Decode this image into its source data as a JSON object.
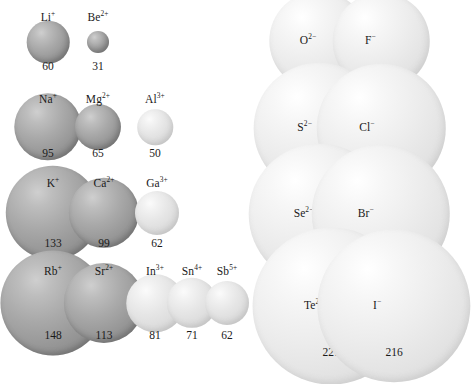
{
  "figure": {
    "background_color": "#ffffff",
    "scale_px_per_pm": 0.355,
    "units": "pm"
  },
  "chart_data": {
    "type": "scatter",
    "xlabel": "",
    "ylabel": "",
    "units": "pm",
    "encoding": "circle diameter proportional to ionic radius value",
    "groups": [
      {
        "name": "cations",
        "fill": "#9a9a9a",
        "label_position": "above-sphere",
        "rows": [
          {
            "period": 2,
            "ions": [
              {
                "label": "Li+",
                "element": "Li",
                "charge": "+",
                "value": 60
              },
              {
                "label": "Be2+",
                "element": "Be",
                "charge": "2+",
                "value": 31
              }
            ]
          },
          {
            "period": 3,
            "ions": [
              {
                "label": "Na+",
                "element": "Na",
                "charge": "+",
                "value": 95
              },
              {
                "label": "Mg2+",
                "element": "Mg",
                "charge": "2+",
                "value": 65
              },
              {
                "label": "Al3+",
                "element": "Al",
                "charge": "3+",
                "value": 50
              }
            ]
          },
          {
            "period": 4,
            "ions": [
              {
                "label": "K+",
                "element": "K",
                "charge": "+",
                "value": 133
              },
              {
                "label": "Ca2+",
                "element": "Ca",
                "charge": "2+",
                "value": 99
              },
              {
                "label": "Ga3+",
                "element": "Ga",
                "charge": "3+",
                "value": 62
              }
            ]
          },
          {
            "period": 5,
            "ions": [
              {
                "label": "Rb+",
                "element": "Rb",
                "charge": "+",
                "value": 148
              },
              {
                "label": "Sr2+",
                "element": "Sr",
                "charge": "2+",
                "value": 113
              },
              {
                "label": "In3+",
                "element": "In",
                "charge": "3+",
                "value": 81
              },
              {
                "label": "Sn4+",
                "element": "Sn",
                "charge": "4+",
                "value": 71
              },
              {
                "label": "Sb5+",
                "element": "Sb",
                "charge": "5+",
                "value": 62
              }
            ]
          }
        ]
      },
      {
        "name": "anions",
        "fill": "#e2e2e2",
        "label_position": "inside-sphere",
        "rows": [
          {
            "period": 2,
            "ions": [
              {
                "label": "O2-",
                "element": "O",
                "charge": "2-",
                "value": 140
              },
              {
                "label": "F-",
                "element": "F",
                "charge": "-",
                "value": 136
              }
            ]
          },
          {
            "period": 3,
            "ions": [
              {
                "label": "S2-",
                "element": "S",
                "charge": "2-",
                "value": 184
              },
              {
                "label": "Cl-",
                "element": "Cl",
                "charge": "-",
                "value": 181
              }
            ]
          },
          {
            "period": 4,
            "ions": [
              {
                "label": "Se2-",
                "element": "Se",
                "charge": "2-",
                "value": 198
              },
              {
                "label": "Br-",
                "element": "Br",
                "charge": "-",
                "value": 195
              }
            ]
          },
          {
            "period": 5,
            "ions": [
              {
                "label": "Te2-",
                "element": "Te",
                "charge": "2-",
                "value": 221
              },
              {
                "label": "I-",
                "element": "I",
                "charge": "-",
                "value": 216
              }
            ]
          }
        ]
      }
    ]
  },
  "layout": {
    "cation_rows": [
      {
        "cy": 42,
        "value_y": 61,
        "label_y": 23,
        "cols": [
          48,
          98
        ]
      },
      {
        "cy": 127,
        "value_y": 148,
        "label_y": 105,
        "cols": [
          48,
          98,
          155
        ]
      },
      {
        "cy": 213,
        "value_y": 238,
        "label_y": 189,
        "cols": [
          53,
          104,
          157
        ]
      },
      {
        "cy": 303,
        "value_y": 330,
        "label_y": 277,
        "cols": [
          53,
          104,
          155,
          192,
          227
        ]
      }
    ],
    "anion_rows": [
      {
        "cy": 41,
        "value_y": 69,
        "cols": [
          319,
          381
        ]
      },
      {
        "cy": 128,
        "value_y": 161,
        "cols": [
          319,
          381
        ]
      },
      {
        "cy": 214,
        "value_y": 250,
        "cols": [
          319,
          381
        ]
      },
      {
        "cy": 306,
        "value_y": 347,
        "cols": [
          331,
          394
        ]
      }
    ]
  }
}
